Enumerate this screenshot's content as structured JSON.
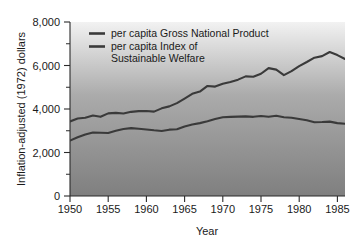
{
  "chart_data": {
    "type": "line",
    "title": "",
    "xlabel": "Year",
    "ylabel": "Inflation-adjusted (1972) dollars",
    "xlim": [
      1950,
      1986
    ],
    "ylim": [
      0,
      8000
    ],
    "grid": false,
    "legend_position": "inside-top-left",
    "y_ticks": [
      0,
      2000,
      4000,
      6000,
      8000
    ],
    "y_tick_labels": [
      "0",
      "2,000",
      "4,000",
      "6,000",
      "8,000"
    ],
    "y_minor_ticks": [
      1000,
      3000,
      5000,
      7000
    ],
    "x_ticks": [
      1950,
      1955,
      1960,
      1965,
      1970,
      1975,
      1980,
      1985
    ],
    "x_tick_labels": [
      "1950",
      "1955",
      "1960",
      "1965",
      "1970",
      "1975",
      "1980",
      "1985"
    ],
    "x": [
      1950,
      1951,
      1952,
      1953,
      1954,
      1955,
      1956,
      1957,
      1958,
      1959,
      1960,
      1961,
      1962,
      1963,
      1964,
      1965,
      1966,
      1967,
      1968,
      1969,
      1970,
      1971,
      1972,
      1973,
      1974,
      1975,
      1976,
      1977,
      1978,
      1979,
      1980,
      1981,
      1982,
      1983,
      1984,
      1985,
      1986
    ],
    "series": [
      {
        "name": "per capita Gross National Product",
        "color": "#3a3a3a",
        "values": [
          3430,
          3560,
          3600,
          3700,
          3640,
          3800,
          3820,
          3790,
          3870,
          3900,
          3910,
          3880,
          4030,
          4120,
          4270,
          4480,
          4700,
          4800,
          5060,
          5030,
          5160,
          5240,
          5350,
          5500,
          5480,
          5620,
          5880,
          5810,
          5560,
          5740,
          5970,
          6160,
          6360,
          6430,
          6620,
          6480,
          6300
        ]
      },
      {
        "name": "per capita Index of Sustainable Welfare",
        "color": "#3a3a3a",
        "values": [
          2550,
          2700,
          2830,
          2920,
          2910,
          2900,
          3000,
          3080,
          3120,
          3090,
          3060,
          3020,
          2990,
          3050,
          3070,
          3200,
          3290,
          3350,
          3440,
          3540,
          3620,
          3640,
          3650,
          3660,
          3640,
          3680,
          3640,
          3690,
          3620,
          3600,
          3540,
          3480,
          3390,
          3400,
          3420,
          3350,
          3320
        ]
      }
    ],
    "legend_entries": [
      {
        "label_line1": "per capita Gross National Product",
        "label_line2": ""
      },
      {
        "label_line1": "per capita Index of",
        "label_line2": "Sustainable Welfare"
      }
    ],
    "background": {
      "gradient_top": "#f2f2f2",
      "gradient_mid": "#a8a8a8",
      "gradient_bottom": "#828282"
    }
  }
}
